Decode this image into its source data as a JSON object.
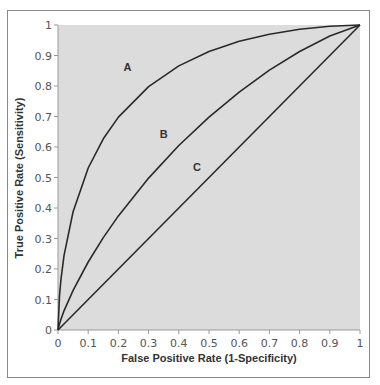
{
  "chart_data": {
    "type": "line",
    "title": "",
    "xlabel": "False Positive Rate (1-Specificity)",
    "ylabel": "True Positive Rate (Sensitivity)",
    "xlim": [
      0,
      1
    ],
    "ylim": [
      0,
      1
    ],
    "grid": false,
    "legend": "none (curves labeled inline A, B, C)",
    "x_ticks": [
      "0",
      "0.1",
      "0.2",
      "0.3",
      "0.4",
      "0.5",
      "0.6",
      "0.7",
      "0.8",
      "0.9",
      "1"
    ],
    "y_ticks": [
      "0",
      "0.1",
      "0.2",
      "0.3",
      "0.4",
      "0.5",
      "0.6",
      "0.7",
      "0.8",
      "0.9",
      "1"
    ],
    "background_color": "#dcdcdc",
    "line_color": "#2a2a2a",
    "series": [
      {
        "name": "A",
        "label_pos": [
          0.23,
          0.85
        ],
        "x": [
          0,
          0.005,
          0.01,
          0.02,
          0.05,
          0.1,
          0.15,
          0.2,
          0.3,
          0.4,
          0.5,
          0.6,
          0.7,
          0.8,
          0.9,
          1
        ],
        "y": [
          0,
          0.112,
          0.167,
          0.244,
          0.388,
          0.531,
          0.627,
          0.698,
          0.798,
          0.866,
          0.913,
          0.947,
          0.97,
          0.986,
          0.996,
          1
        ]
      },
      {
        "name": "B",
        "label_pos": [
          0.35,
          0.63
        ],
        "x": [
          0,
          0.005,
          0.01,
          0.02,
          0.05,
          0.1,
          0.15,
          0.2,
          0.3,
          0.4,
          0.5,
          0.6,
          0.7,
          0.8,
          0.9,
          1
        ],
        "y": [
          0,
          0.02,
          0.035,
          0.063,
          0.13,
          0.223,
          0.303,
          0.374,
          0.498,
          0.605,
          0.698,
          0.78,
          0.852,
          0.913,
          0.964,
          1
        ]
      },
      {
        "name": "C",
        "label_pos": [
          0.46,
          0.52
        ],
        "x": [
          0,
          1
        ],
        "y": [
          0,
          1
        ]
      }
    ]
  }
}
